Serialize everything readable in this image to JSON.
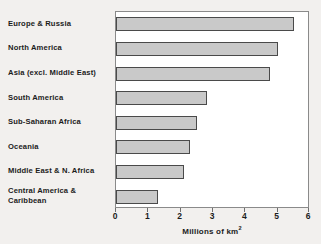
{
  "chart_data": {
    "type": "bar",
    "orientation": "horizontal",
    "title": "",
    "xlabel": "Millions of km2",
    "xlabel_text": "Millions of km",
    "xlabel_sup": "2",
    "ylabel": "",
    "categories": [
      "Europe & Russia",
      "North America",
      "Asia (excl. Middle East)",
      "South America",
      "Sub-Saharan Africa",
      "Oceania",
      "Middle East & N. Africa",
      "Central America & Caribbean"
    ],
    "category_lines": [
      [
        "Europe & Russia"
      ],
      [
        "North America"
      ],
      [
        "Asia (excl. Middle East)"
      ],
      [
        "South America"
      ],
      [
        "Sub-Saharan Africa"
      ],
      [
        "Oceania"
      ],
      [
        "Middle East & N. Africa"
      ],
      [
        "Central America &",
        "Caribbean"
      ]
    ],
    "values": [
      5.5,
      5.0,
      4.75,
      2.8,
      2.5,
      2.3,
      2.1,
      1.3
    ],
    "xlim": [
      0,
      6
    ],
    "xticks": [
      0,
      1,
      2,
      3,
      4,
      5,
      6
    ],
    "xticklabels": [
      "0",
      "1",
      "2",
      "3",
      "4",
      "5",
      "6"
    ],
    "grid": false,
    "legend": null,
    "bar_color": "#c9c9c9",
    "bar_edge_color": "#4a4a4a",
    "plot_background": "#ffffff",
    "page_background": "#f2f0ee",
    "text_color": "#1c1c1c"
  }
}
